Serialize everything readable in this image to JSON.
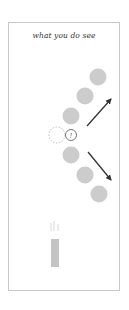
{
  "panel": {
    "title": "what you do see",
    "marker_glyph": "!"
  },
  "colors": {
    "ball": "#cccccc",
    "frame": "#c8c8c8",
    "arrow": "#333333",
    "ghost": "#bbbbbb",
    "paddle": "#c4c4c4",
    "text": "#333333"
  }
}
